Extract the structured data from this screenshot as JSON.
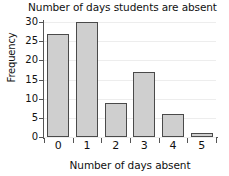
{
  "chart_data": {
    "type": "bar",
    "title": "Number of days students are absent",
    "xlabel": "Number of days absent",
    "ylabel": "Frequency",
    "categories": [
      "0",
      "1",
      "2",
      "3",
      "4",
      "5"
    ],
    "values": [
      27,
      30,
      9,
      17,
      6,
      1
    ],
    "ylim": [
      0,
      30
    ],
    "yticks": [
      0,
      5,
      10,
      15,
      20,
      25,
      30
    ],
    "ytick_labels": [
      "0",
      "5",
      "10",
      "15",
      "20",
      "25",
      "30"
    ],
    "grid": true,
    "grid_axis": "y",
    "legend": false,
    "bar_fill_color": "#cfcfcf",
    "bar_edge_color": "#4a4a4a",
    "axis_color": "#555555",
    "grid_color": "#ededed",
    "background_color": "#ffffff"
  }
}
